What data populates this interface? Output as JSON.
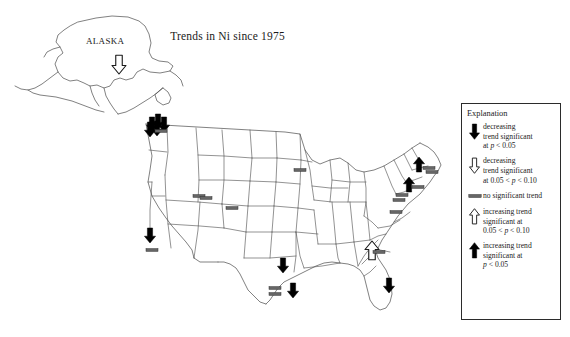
{
  "figure": {
    "title": "Trends in Ni since 1975",
    "background_color": "#ffffff",
    "line_color": "#2b2b2b"
  },
  "map": {
    "alaska_label": "ALASKA",
    "inset_name": "alaska-inset",
    "main_name": "conterminous-united-states"
  },
  "legend": {
    "title": "Explanation",
    "border_color": "#2b2b2b",
    "entries": [
      {
        "symbol": "solid-down-arrow",
        "symbol_fill": "#000000",
        "line1": "decreasing",
        "line2": "trend significant",
        "line3_prefix": "at ",
        "line3_italic": "p",
        "line3_suffix": " < 0.05"
      },
      {
        "symbol": "hollow-down-arrow",
        "symbol_fill": "#ffffff",
        "line1": "decreasing",
        "line2": "trend significant",
        "line3_prefix": "at 0.05 < ",
        "line3_italic": "p",
        "line3_suffix": " < 0.10"
      },
      {
        "symbol": "horizontal-bar",
        "symbol_fill": "#555555",
        "line1": "no significant trend",
        "line2": "",
        "line3_prefix": "",
        "line3_italic": "",
        "line3_suffix": ""
      },
      {
        "symbol": "hollow-up-arrow",
        "symbol_fill": "#ffffff",
        "line1": "increasing trend",
        "line2": "significant at",
        "line3_prefix": "0.05 < ",
        "line3_italic": "p",
        "line3_suffix": " < 0.10"
      },
      {
        "symbol": "solid-up-arrow",
        "symbol_fill": "#000000",
        "line1": "increasing trend",
        "line2": "significant at",
        "line3_prefix": "",
        "line3_italic": "p",
        "line3_suffix": " < 0.05"
      }
    ]
  },
  "chart_data": {
    "type": "map",
    "title": "Trends in Ni since 1975",
    "subtitle": "",
    "xlabel": "",
    "ylabel": "",
    "projection": "conterminous United States with Alaska inset",
    "symbol_classes": [
      {
        "key": "decreasing_significant",
        "glyph": "solid-down-arrow",
        "label": "decreasing trend significant at p < 0.05"
      },
      {
        "key": "decreasing_marginal",
        "glyph": "hollow-down-arrow",
        "label": "decreasing trend significant at 0.05 < p < 0.10"
      },
      {
        "key": "no_trend",
        "glyph": "horizontal-bar",
        "label": "no significant trend"
      },
      {
        "key": "increasing_marginal",
        "glyph": "hollow-up-arrow",
        "label": "increasing trend significant at 0.05 < p < 0.10"
      },
      {
        "key": "increasing_significant",
        "glyph": "solid-up-arrow",
        "label": "increasing trend significant at p < 0.05"
      }
    ],
    "markers": [
      {
        "id": "ak-1",
        "region": "Alaska",
        "class": "decreasing_marginal",
        "x": 119,
        "y": 64
      },
      {
        "id": "wa-1",
        "region": "Washington",
        "class": "decreasing_significant",
        "x": 152,
        "y": 124
      },
      {
        "id": "wa-2",
        "region": "Washington",
        "class": "decreasing_significant",
        "x": 158,
        "y": 121
      },
      {
        "id": "wa-3",
        "region": "Washington",
        "class": "decreasing_significant",
        "x": 164,
        "y": 124
      },
      {
        "id": "wa-4",
        "region": "Washington",
        "class": "decreasing_significant",
        "x": 157,
        "y": 128
      },
      {
        "id": "wa-5",
        "region": "Washington",
        "class": "decreasing_significant",
        "x": 150,
        "y": 129
      },
      {
        "id": "wa-6",
        "region": "Washington",
        "class": "no_trend",
        "x": 161,
        "y": 131
      },
      {
        "id": "ut-1",
        "region": "Utah-Wyoming",
        "class": "no_trend",
        "x": 199,
        "y": 196
      },
      {
        "id": "ut-2",
        "region": "Utah-Wyoming",
        "class": "no_trend",
        "x": 206,
        "y": 198
      },
      {
        "id": "co-1",
        "region": "Colorado",
        "class": "no_trend",
        "x": 232,
        "y": 208
      },
      {
        "id": "ca-1",
        "region": "Southern California",
        "class": "decreasing_significant",
        "x": 150,
        "y": 235
      },
      {
        "id": "ca-2",
        "region": "Southern California",
        "class": "no_trend",
        "x": 152,
        "y": 250
      },
      {
        "id": "mn-1",
        "region": "Minnesota",
        "class": "no_trend",
        "x": 300,
        "y": 170
      },
      {
        "id": "tx-1",
        "region": "North Texas",
        "class": "decreasing_significant",
        "x": 283,
        "y": 265
      },
      {
        "id": "tx-2",
        "region": "South Texas",
        "class": "decreasing_significant",
        "x": 293,
        "y": 290
      },
      {
        "id": "tx-3",
        "region": "South Texas",
        "class": "no_trend",
        "x": 275,
        "y": 288
      },
      {
        "id": "tx-4",
        "region": "South Texas",
        "class": "no_trend",
        "x": 275,
        "y": 294
      },
      {
        "id": "ga-1",
        "region": "Georgia",
        "class": "increasing_marginal",
        "x": 372,
        "y": 251
      },
      {
        "id": "ga-2",
        "region": "Georgia",
        "class": "no_trend",
        "x": 379,
        "y": 252
      },
      {
        "id": "fl-1",
        "region": "Florida",
        "class": "decreasing_significant",
        "x": 389,
        "y": 285
      },
      {
        "id": "ne-1",
        "region": "New England",
        "class": "increasing_significant",
        "x": 419,
        "y": 165
      },
      {
        "id": "ne-2",
        "region": "New England",
        "class": "no_trend",
        "x": 429,
        "y": 168
      },
      {
        "id": "ne-3",
        "region": "New England",
        "class": "no_trend",
        "x": 432,
        "y": 172
      },
      {
        "id": "ne-4",
        "region": "Mid-Atlantic",
        "class": "increasing_significant",
        "x": 409,
        "y": 185
      },
      {
        "id": "ne-5",
        "region": "Mid-Atlantic",
        "class": "no_trend",
        "x": 418,
        "y": 187
      },
      {
        "id": "ne-6",
        "region": "Mid-Atlantic",
        "class": "no_trend",
        "x": 402,
        "y": 195
      },
      {
        "id": "ne-7",
        "region": "Mid-Atlantic",
        "class": "no_trend",
        "x": 399,
        "y": 200
      },
      {
        "id": "ne-8",
        "region": "Mid-Atlantic",
        "class": "no_trend",
        "x": 396,
        "y": 212
      }
    ]
  }
}
